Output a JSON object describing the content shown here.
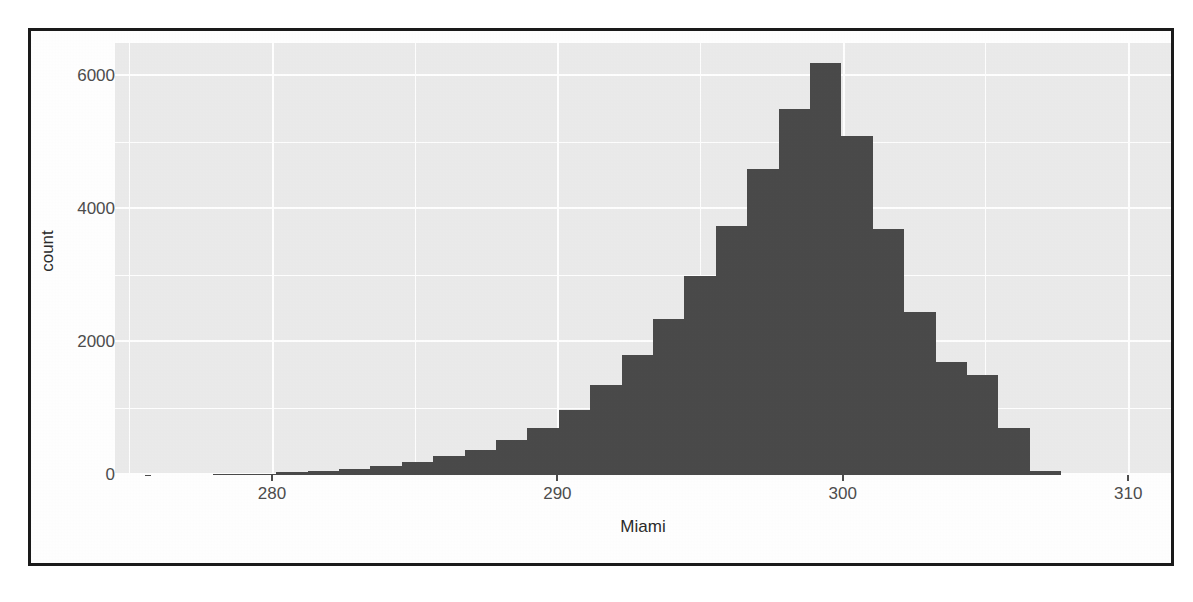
{
  "figure": {
    "border_color": "#1a1a1a",
    "panel_color": "#ebebeb",
    "gridline_color": "#ffffff",
    "bar_color": "#4a4a4a",
    "axis_text_color": "#4d4d4d"
  },
  "axes": {
    "x_title": "Miami",
    "y_title": "count",
    "x_ticks": [
      "280",
      "290",
      "300",
      "310"
    ],
    "y_ticks": [
      "0",
      "2000",
      "4000",
      "6000"
    ]
  },
  "chart_data": {
    "type": "bar",
    "title": "",
    "subtitle": "",
    "xlabel": "Miami",
    "ylabel": "count",
    "xlim": [
      274.5,
      311.5
    ],
    "ylim": [
      0,
      6500
    ],
    "xticks": [
      280,
      290,
      300,
      310
    ],
    "yticks": [
      0,
      2000,
      4000,
      6000
    ],
    "grid": true,
    "legend": null,
    "bin_width": 1.1,
    "bin_centers": [
      278.5,
      279.6,
      280.7,
      281.8,
      282.9,
      284.0,
      285.1,
      286.2,
      287.3,
      288.4,
      289.5,
      290.6,
      291.7,
      292.8,
      293.9,
      295.0,
      296.1,
      297.2,
      298.3,
      299.4,
      300.5,
      301.6,
      302.7,
      303.8,
      304.9,
      306.0,
      307.1
    ],
    "categories": [
      "278.5",
      "279.6",
      "280.7",
      "281.8",
      "282.9",
      "284.0",
      "285.1",
      "286.2",
      "287.3",
      "288.4",
      "289.5",
      "290.6",
      "291.7",
      "292.8",
      "293.9",
      "295.0",
      "296.1",
      "297.2",
      "298.3",
      "299.4",
      "300.5",
      "301.6",
      "302.7",
      "303.8",
      "304.9",
      "306.0",
      "307.1"
    ],
    "values": [
      10,
      20,
      40,
      60,
      90,
      140,
      200,
      280,
      380,
      520,
      700,
      980,
      1350,
      1800,
      2350,
      3000,
      3750,
      4600,
      5500,
      6200,
      5100,
      3700,
      2450,
      1700,
      1500,
      700,
      60
    ]
  }
}
